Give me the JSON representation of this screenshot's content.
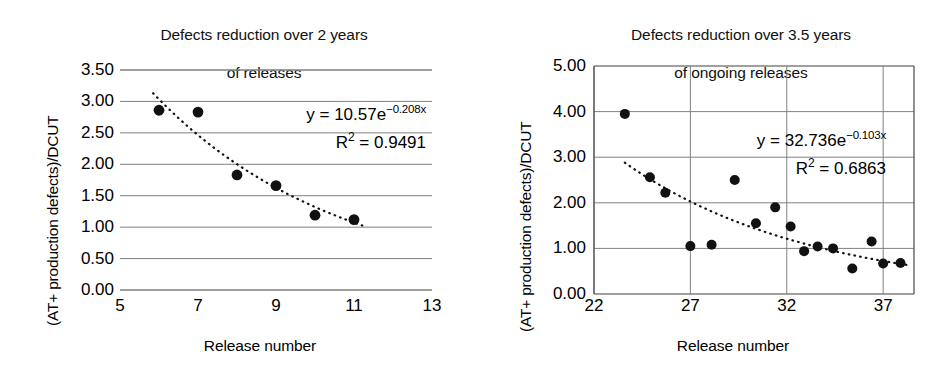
{
  "chart_data": [
    {
      "id": "left",
      "type": "scatter",
      "title": "Defects reduction over 2 years\nof releases",
      "title_line1": "Defects reduction over 2 years",
      "title_line2": "of releases",
      "xlabel": "Release number",
      "ylabel": "(AT+ production defects)/DCUT",
      "xlim": [
        5,
        13
      ],
      "ylim": [
        0.0,
        3.5
      ],
      "xticks": [
        "5",
        "7",
        "9",
        "11",
        "13"
      ],
      "xtick_values": [
        5,
        7,
        9,
        11,
        13
      ],
      "yticks": [
        "0.00",
        "0.50",
        "1.00",
        "1.50",
        "2.00",
        "2.50",
        "3.00",
        "3.50"
      ],
      "ytick_values": [
        0.0,
        0.5,
        1.0,
        1.5,
        2.0,
        2.5,
        3.0,
        3.5
      ],
      "grid": "horizontal",
      "legend": "none",
      "marker_color": "#111111",
      "x": [
        6,
        7,
        8,
        9,
        10,
        11
      ],
      "values": [
        2.86,
        2.83,
        1.83,
        1.66,
        1.19,
        1.12
      ],
      "points": [
        {
          "x": 6,
          "y": 2.86
        },
        {
          "x": 7,
          "y": 2.83
        },
        {
          "x": 8,
          "y": 1.83
        },
        {
          "x": 9,
          "y": 1.66
        },
        {
          "x": 10,
          "y": 1.19
        },
        {
          "x": 11,
          "y": 1.12
        }
      ],
      "trendline": {
        "type": "exponential",
        "style": "dotted",
        "a": 10.57,
        "b": -0.208,
        "r2": 0.9491,
        "x_start": 5.85,
        "x_end": 11.25,
        "equation_text": "y = 10.57e",
        "equation_exponent": "−0.208x",
        "r2_label": "R",
        "r2_text": " = 0.9491"
      }
    },
    {
      "id": "right",
      "type": "scatter",
      "title": "Defects reduction over 3.5 years\nof ongoing releases",
      "title_line1": "Defects reduction over 3.5 years",
      "title_line2": "of ongoing releases",
      "xlabel": "Release number",
      "ylabel": "(AT+ production defects)/DCUT",
      "xlim": [
        22,
        38.6
      ],
      "ylim": [
        0.0,
        5.0
      ],
      "xticks": [
        "22",
        "27",
        "32",
        "37"
      ],
      "xtick_values": [
        22,
        27,
        32,
        37
      ],
      "yticks": [
        "0.00",
        "1.00",
        "2.00",
        "3.00",
        "4.00",
        "5.00"
      ],
      "ytick_values": [
        0.0,
        1.0,
        2.0,
        3.0,
        4.0,
        5.0
      ],
      "grid": "both",
      "legend": "none",
      "marker_color": "#111111",
      "x": [
        23.6,
        24.9,
        25.7,
        27.0,
        28.1,
        29.3,
        30.4,
        31.4,
        32.2,
        32.9,
        33.6,
        34.4,
        35.4,
        36.4,
        37.0,
        37.9
      ],
      "values": [
        3.95,
        2.56,
        2.22,
        1.05,
        1.08,
        2.5,
        1.55,
        1.9,
        1.48,
        0.94,
        1.04,
        1.0,
        0.56,
        1.15,
        0.67,
        0.68
      ],
      "points": [
        {
          "x": 23.6,
          "y": 3.95
        },
        {
          "x": 24.9,
          "y": 2.56
        },
        {
          "x": 25.7,
          "y": 2.22
        },
        {
          "x": 27.0,
          "y": 1.05
        },
        {
          "x": 28.1,
          "y": 1.08
        },
        {
          "x": 29.3,
          "y": 2.5
        },
        {
          "x": 30.4,
          "y": 1.55
        },
        {
          "x": 31.4,
          "y": 1.9
        },
        {
          "x": 32.2,
          "y": 1.48
        },
        {
          "x": 32.9,
          "y": 0.94
        },
        {
          "x": 33.6,
          "y": 1.04
        },
        {
          "x": 34.4,
          "y": 1.0
        },
        {
          "x": 35.4,
          "y": 0.56
        },
        {
          "x": 36.4,
          "y": 1.15
        },
        {
          "x": 37.0,
          "y": 0.67
        },
        {
          "x": 37.9,
          "y": 0.68
        }
      ],
      "trendline": {
        "type": "exponential",
        "style": "dotted",
        "a": 32.736,
        "b": -0.103,
        "r2": 0.6863,
        "x_start": 23.6,
        "x_end": 38.4,
        "equation_text": "y = 32.736e",
        "equation_exponent": "−0.103x",
        "r2_label": "R",
        "r2_text": " = 0.6863"
      }
    }
  ]
}
